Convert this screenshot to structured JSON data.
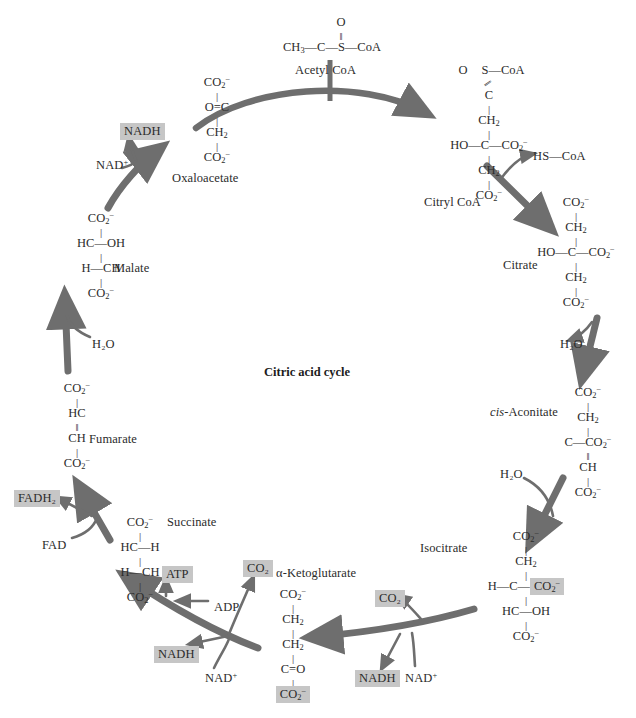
{
  "diagram": {
    "title": "Citric acid cycle",
    "type": "metabolic-cycle",
    "accent_arrow_color": "#6e6e6e",
    "highlight_color": "#c6c6c6",
    "text_color": "#2b2b2b"
  },
  "center": {
    "label": "Citric acid cycle"
  },
  "metabolites": {
    "acetyl_coa": {
      "name": "Acetyl CoA",
      "formula_lines": [
        "O",
        "‖",
        "CH₃—C—S—CoA"
      ]
    },
    "oxaloacetate": {
      "name": "Oxaloacetate",
      "formula_lines": [
        "CO₂⁻",
        "|",
        "O=C",
        "|",
        "CH₂",
        "|",
        "CO₂⁻"
      ]
    },
    "citryl_coa": {
      "name": "Citryl CoA",
      "formula_lines": [
        "O  S—CoA",
        "\\\\ /",
        "C",
        "|",
        "CH₂",
        "|",
        "HO—C—CO₂⁻",
        "|",
        "CH₂",
        "|",
        "CO₂⁻"
      ]
    },
    "citrate": {
      "name": "Citrate",
      "formula_lines": [
        "CO₂⁻",
        "|",
        "CH₂",
        "|",
        "HO—C—CO₂⁻",
        "|",
        "CH₂",
        "|",
        "CO₂⁻"
      ]
    },
    "cis_aconitate": {
      "name": "cis-Aconitate",
      "name_italic_prefix": "cis",
      "name_rest": "-Aconitate",
      "formula_lines": [
        "CO₂⁻",
        "|",
        "CH₂",
        "|",
        "C—CO₂⁻",
        "‖",
        "CH",
        "|",
        "CO₂⁻"
      ]
    },
    "isocitrate": {
      "name": "Isocitrate",
      "formula_lines": [
        "CO₂⁻",
        "|",
        "CH₂",
        "|",
        "H—C—CO₂⁻",
        "|",
        "HC—OH",
        "|",
        "CO₂⁻"
      ],
      "highlighted_group": "CO₂⁻"
    },
    "alpha_ketoglutarate": {
      "name": "α-Ketoglutarate",
      "formula_lines": [
        "CO₂⁻",
        "|",
        "CH₂",
        "|",
        "CH₂",
        "|",
        "C=O",
        "|",
        "CO₂⁻"
      ],
      "highlighted_group": "CO₂⁻"
    },
    "succinate": {
      "name": "Succinate",
      "formula_lines": [
        "CO₂⁻",
        "|",
        "HC—H",
        "|",
        "H—CH",
        "|",
        "CO₂⁻"
      ]
    },
    "fumarate": {
      "name": "Fumarate",
      "formula_lines": [
        "CO₂⁻",
        "|",
        "HC",
        "‖",
        "CH",
        "|",
        "CO₂⁻"
      ]
    },
    "malate": {
      "name": "Malate",
      "formula_lines": [
        "CO₂⁻",
        "|",
        "HC—OH",
        "|",
        "H—CH",
        "|",
        "CO₂⁻"
      ]
    }
  },
  "cofactors": [
    {
      "id": "nad-plus-malate",
      "label": "NAD",
      "charge": "+",
      "highlighted": false,
      "x": 96,
      "y": 159
    },
    {
      "id": "nadh-malate",
      "label": "NADH",
      "charge": "",
      "highlighted": true,
      "x": 120,
      "y": 125
    },
    {
      "id": "hs-coa",
      "label": "HS—CoA",
      "charge": "",
      "highlighted": false,
      "x": 533,
      "y": 150
    },
    {
      "id": "h2o-citrate",
      "label": "H₂O",
      "charge": "",
      "highlighted": false,
      "x": 560,
      "y": 338
    },
    {
      "id": "h2o-isocitrate",
      "label": "H₂O",
      "charge": "",
      "highlighted": false,
      "x": 500,
      "y": 468
    },
    {
      "id": "co2-isocitrate",
      "label": "CO₂",
      "charge": "",
      "highlighted": true,
      "x": 375,
      "y": 592
    },
    {
      "id": "nadh-isocitrate",
      "label": "NADH",
      "charge": "",
      "highlighted": true,
      "x": 355,
      "y": 672
    },
    {
      "id": "nad-plus-isocitrate",
      "label": "NAD",
      "charge": "+",
      "highlighted": false,
      "x": 405,
      "y": 672
    },
    {
      "id": "co2-ketoglutarate",
      "label": "CO₂",
      "charge": "",
      "highlighted": true,
      "x": 243,
      "y": 562
    },
    {
      "id": "nadh-ketoglutarate",
      "label": "NADH",
      "charge": "",
      "highlighted": true,
      "x": 154,
      "y": 648
    },
    {
      "id": "nad-plus-ketoglutarate",
      "label": "NAD",
      "charge": "+",
      "highlighted": false,
      "x": 205,
      "y": 672
    },
    {
      "id": "atp",
      "label": "ATP",
      "charge": "",
      "highlighted": true,
      "x": 162,
      "y": 568
    },
    {
      "id": "adp",
      "label": "ADP",
      "charge": "",
      "highlighted": false,
      "x": 214,
      "y": 601
    },
    {
      "id": "fadh2",
      "label": "FADH₂",
      "charge": "",
      "highlighted": true,
      "x": 14,
      "y": 492
    },
    {
      "id": "fad",
      "label": "FAD",
      "charge": "",
      "highlighted": false,
      "x": 42,
      "y": 539
    },
    {
      "id": "h2o-fumarate",
      "label": "H₂O",
      "charge": "",
      "highlighted": false,
      "x": 92,
      "y": 338
    }
  ]
}
